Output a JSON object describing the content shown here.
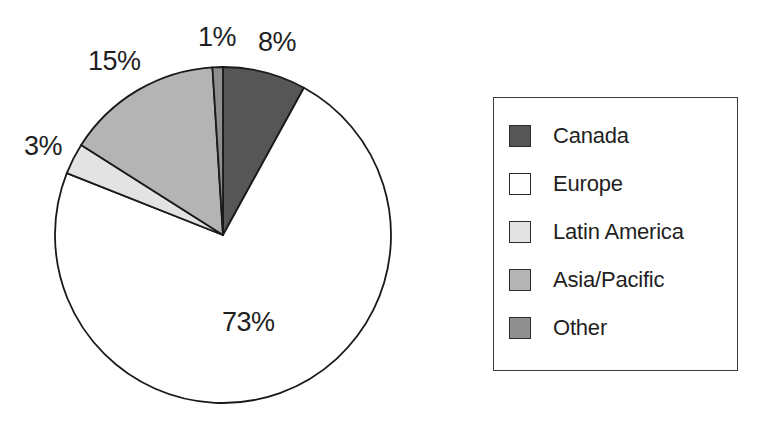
{
  "chart_data": {
    "type": "pie",
    "title": "",
    "subtitle": "",
    "xlabel": "",
    "ylabel": "",
    "legend_position": "right",
    "grid": false,
    "start_angle_deg": 0,
    "direction": "clockwise",
    "categories": [
      "Canada",
      "Europe",
      "Latin America",
      "Asia/Pacific",
      "Other"
    ],
    "values": [
      8,
      73,
      3,
      15,
      1
    ],
    "value_unit": "%",
    "data_labels": [
      "8%",
      "73%",
      "3%",
      "15%",
      "1%"
    ],
    "slice_colors": [
      "#565656",
      "#ffffff",
      "#e3e3e3",
      "#b4b4b4",
      "#8f8f8f"
    ],
    "slices": [
      {
        "label": "Canada",
        "value": 8,
        "data_label": "8%",
        "color": "#565656",
        "swatch": "dark-gray-swatch"
      },
      {
        "label": "Europe",
        "value": 73,
        "data_label": "73%",
        "color": "#ffffff",
        "swatch": "white-swatch"
      },
      {
        "label": "Latin America",
        "value": 3,
        "data_label": "3%",
        "color": "#e3e3e3",
        "swatch": "very-light-gray-swatch"
      },
      {
        "label": "Asia/Pacific",
        "value": 15,
        "data_label": "15%",
        "color": "#b4b4b4",
        "swatch": "light-gray-swatch"
      },
      {
        "label": "Other",
        "value": 1,
        "data_label": "1%",
        "color": "#8f8f8f",
        "swatch": "medium-gray-swatch"
      }
    ]
  },
  "legend": {
    "items": [
      {
        "label": "Canada"
      },
      {
        "label": "Europe"
      },
      {
        "label": "Latin America"
      },
      {
        "label": "Asia/Pacific"
      },
      {
        "label": "Other"
      }
    ]
  },
  "labels": {
    "canada": "8%",
    "europe": "73%",
    "latin_america": "3%",
    "asia_pacific": "15%",
    "other": "1%"
  },
  "style": {
    "outline_color": "#1a1a1a",
    "background": "#ffffff"
  }
}
